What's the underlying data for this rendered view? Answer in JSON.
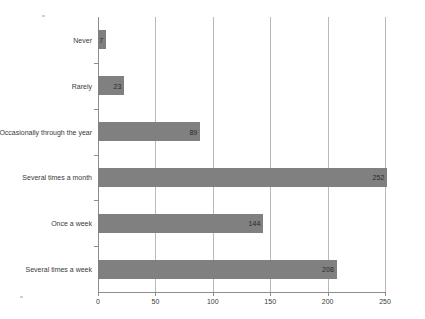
{
  "chart_data": {
    "type": "bar",
    "orientation": "horizontal",
    "title": "",
    "xlabel": "",
    "ylabel": "",
    "xlim": [
      0,
      250
    ],
    "xticks": [
      0,
      50,
      100,
      150,
      200,
      250
    ],
    "grid": true,
    "legend": false,
    "bar_color": "#808080",
    "categories": [
      "Never",
      "Rarely",
      "Occasionally through the year",
      "Several times a month",
      "Once a week",
      "Several times a week"
    ],
    "values": [
      7,
      23,
      89,
      252,
      144,
      208
    ],
    "value_labels": [
      "7",
      "23",
      "89",
      "252",
      "144",
      "208"
    ],
    "tick_labels": [
      "0",
      "50",
      "100",
      "150",
      "200",
      "250"
    ]
  }
}
